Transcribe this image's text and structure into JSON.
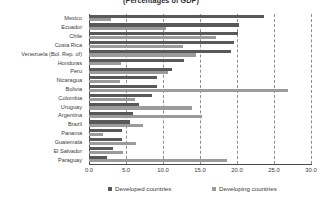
{
  "chart_data": {
    "type": "bar",
    "orientation": "horizontal",
    "title": "(Percentages of GDP)",
    "xlabel": "",
    "ylabel": "",
    "xlim": [
      0.0,
      30.0
    ],
    "xticks": [
      "0.0",
      "5.0",
      "10.0",
      "15.0",
      "20.0",
      "25.0",
      "30.0"
    ],
    "xtick_values": [
      0.0,
      5.0,
      10.0,
      15.0,
      20.0,
      25.0,
      30.0
    ],
    "grid": true,
    "grid_axis": "x",
    "grid_style": "dashed",
    "legend_position": "bottom",
    "categories": [
      "Mexico",
      "Ecuador",
      "Chile",
      "Costa Rica",
      "Venezuela (Bol. Rep. of)",
      "Honduras",
      "Peru",
      "Nicaragua",
      "Bolivia",
      "Colombia",
      "Uruguay",
      "Argentina",
      "Brazil",
      "Panama",
      "Guatemala",
      "El Salvador",
      "Paraguay"
    ],
    "series": [
      {
        "name": "Developed countries",
        "color": "#595959",
        "values": [
          23.7,
          20.3,
          20.2,
          19.6,
          19.2,
          12.9,
          11.2,
          9.2,
          9.2,
          8.5,
          6.7,
          5.9,
          5.6,
          4.5,
          4.4,
          3.3,
          2.4
        ]
      },
      {
        "name": "Developing countries",
        "color": "#9b9b9b",
        "values": [
          3.0,
          10.4,
          17.1,
          12.7,
          14.4,
          4.3,
          10.7,
          4.2,
          26.9,
          6.2,
          13.9,
          15.3,
          7.3,
          1.9,
          6.4,
          4.6,
          18.6
        ]
      }
    ]
  },
  "legend": {
    "items": [
      {
        "label": "Developed countries",
        "key": "developed"
      },
      {
        "label": "Developing countries",
        "key": "developing"
      }
    ]
  }
}
